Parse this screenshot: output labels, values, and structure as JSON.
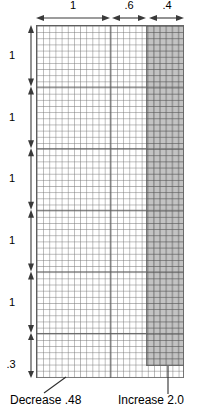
{
  "diagram": {
    "colors": {
      "shade_fill": "#8c8c8c",
      "grid_line": "#787878",
      "major_line": "#5a5a5a",
      "annotation": "#3a3a3a",
      "background": "#ffffff"
    },
    "grid": {
      "cell_size_px": 6.16,
      "major_every_cells": 10,
      "columns_total": 24,
      "rows_total": 57
    },
    "horizontal_dimensions": [
      {
        "label": "1",
        "name": "top-dim-1"
      },
      {
        "label": ".6",
        "name": "top-dim-6"
      },
      {
        "label": ".4",
        "name": "top-dim-4"
      }
    ],
    "vertical_dimensions": [
      {
        "label": "1",
        "name": "left-dim-1a"
      },
      {
        "label": "1",
        "name": "left-dim-1b"
      },
      {
        "label": "1",
        "name": "left-dim-1c"
      },
      {
        "label": "1",
        "name": "left-dim-1d"
      },
      {
        "label": "1",
        "name": "left-dim-1e"
      },
      {
        "label": ".3",
        "name": "left-dim-3"
      }
    ],
    "callouts": {
      "decrease": "Decrease .48",
      "increase": "Increase 2.0"
    }
  }
}
